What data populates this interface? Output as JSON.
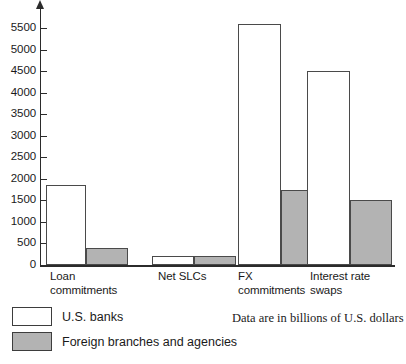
{
  "chart_data": {
    "type": "bar",
    "title": "",
    "subtitle": "",
    "xlabel": "",
    "ylabel": "",
    "ylim": [
      0,
      5750
    ],
    "grid": false,
    "legend_position": "bottom-left",
    "note": "Data are in billions of U.S. dollars",
    "categories": [
      "Loan\ncommitments",
      "Net SLCs",
      "FX\ncommitments",
      "Interest rate\nswaps"
    ],
    "yticks": [
      0,
      500,
      1000,
      1500,
      2000,
      2500,
      3000,
      3500,
      4000,
      4500,
      5000,
      5500
    ],
    "ytick_labels": [
      "0",
      "500",
      "1000",
      "1500",
      "2000",
      "2500",
      "3000",
      "3500",
      "4000",
      "4500",
      "5000",
      "5500"
    ],
    "series": [
      {
        "name": "U.S. banks",
        "color": "#ffffff",
        "values": [
          1850,
          200,
          5600,
          4500
        ]
      },
      {
        "name": "Foreign branches and agencies",
        "color": "#b3b3b3",
        "values": [
          400,
          200,
          1750,
          1500
        ]
      }
    ]
  },
  "legend": {
    "items": [
      {
        "label": "U.S. banks",
        "swatch": "white"
      },
      {
        "label": "Foreign branches and agencies",
        "swatch": "gray"
      }
    ]
  },
  "axis": {
    "y_arrow_icon": "arrow-up-icon"
  }
}
